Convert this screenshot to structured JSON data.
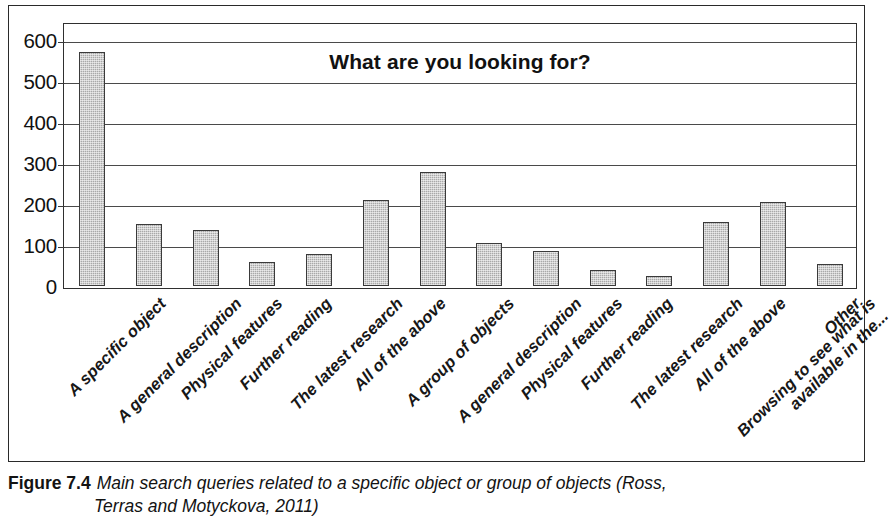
{
  "chart_data": {
    "type": "bar",
    "title": "What are you looking for?",
    "xlabel": "",
    "ylabel": "",
    "ylim": [
      0,
      600
    ],
    "yticks": [
      0,
      100,
      200,
      300,
      400,
      500,
      600
    ],
    "grid": true,
    "legend": "none",
    "bar_color": "#a9a9a9",
    "bar_border_color": "#3a3a3a",
    "categories": [
      "A specific object",
      "A general description",
      "Physical features",
      "Further reading",
      "The latest research",
      "All of the above",
      "A group of objects",
      "A general description",
      "Physical features",
      "Further reading",
      "The latest research",
      "All of the above",
      "Browsing to see what is available in the...",
      "Other"
    ],
    "category_lines": [
      [
        "A specific object"
      ],
      [
        "A general description"
      ],
      [
        "Physical features"
      ],
      [
        "Further reading"
      ],
      [
        "The latest research"
      ],
      [
        "All of the above"
      ],
      [
        "A group of objects"
      ],
      [
        "A general description"
      ],
      [
        "Physical features"
      ],
      [
        "Further reading"
      ],
      [
        "The latest research"
      ],
      [
        "All of the above"
      ],
      [
        "Browsing to see what is",
        "available in the..."
      ],
      [
        "Other"
      ]
    ],
    "values": [
      570,
      152,
      136,
      58,
      78,
      210,
      279,
      104,
      85,
      38,
      25,
      155,
      205,
      53
    ]
  },
  "caption": {
    "figure_number": "Figure 7.4",
    "line1": "Main search queries related to a specific object or group of objects (Ross,",
    "line2": "Terras and Motyckova, 2011)"
  }
}
